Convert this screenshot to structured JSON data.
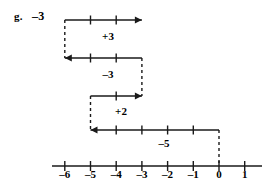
{
  "figure": {
    "item_letter": "g.",
    "item_answer": "–3",
    "caption_type": "number-line-jump-diagram"
  },
  "number_line": {
    "min": -6,
    "max": 1,
    "axis_y": 166,
    "px_per_unit": 25.7,
    "x_at_zero": 219,
    "tick_values": [
      -6,
      -5,
      -4,
      -3,
      -2,
      -1,
      0,
      1
    ],
    "tick_labels": [
      "–6",
      "–5",
      "–4",
      "–3",
      "–2",
      "–1",
      "0",
      "1"
    ],
    "tick_half_height": 5,
    "axis_x_start": 52,
    "axis_x_end": 262,
    "color": "#1a1a1a"
  },
  "jumps": [
    {
      "name": "jump-plus-3",
      "label": "+3",
      "from": -6,
      "to": -3,
      "direction": "right",
      "row_y": 20,
      "label_x": 108,
      "label_y": 30
    },
    {
      "name": "jump-minus-3",
      "label": "–3",
      "from": -3,
      "to": -6,
      "direction": "left",
      "row_y": 58,
      "label_x": 108,
      "label_y": 68
    },
    {
      "name": "jump-plus-2",
      "label": "+2",
      "from": -5,
      "to": -3,
      "direction": "right",
      "row_y": 96,
      "label_x": 121,
      "label_y": 105
    },
    {
      "name": "jump-minus-5",
      "label": "–5",
      "from": 0,
      "to": -5,
      "direction": "left",
      "row_y": 130,
      "label_x": 164,
      "label_y": 137
    }
  ],
  "connectors": [
    {
      "name": "connector-at-minus-6",
      "x_value": -6,
      "y_top": 20,
      "y_bottom": 58
    },
    {
      "name": "connector-at-minus-3",
      "x_value": -3,
      "y_top": 58,
      "y_bottom": 96
    },
    {
      "name": "connector-at-minus-5",
      "x_value": -5,
      "y_top": 96,
      "y_bottom": 130
    },
    {
      "name": "connector-at-zero",
      "x_value": 0,
      "y_top": 130,
      "y_bottom": 166
    }
  ],
  "style": {
    "stroke_color": "#1a1a1a",
    "stroke_width": 1.4,
    "dash_pattern": "3,3",
    "background": "#ffffff"
  }
}
